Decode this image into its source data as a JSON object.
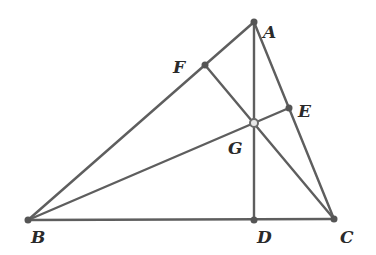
{
  "diagram": {
    "type": "triangle-altitudes-orthocenter",
    "points": {
      "A": {
        "label": "A",
        "x": 254,
        "y": 22,
        "lx": 263,
        "ly": 38
      },
      "B": {
        "label": "B",
        "x": 28,
        "y": 220,
        "lx": 31,
        "ly": 243
      },
      "C": {
        "label": "C",
        "x": 334,
        "y": 219,
        "lx": 340,
        "ly": 243
      },
      "D": {
        "label": "D",
        "x": 254,
        "y": 220,
        "lx": 257,
        "ly": 243
      },
      "E": {
        "label": "E",
        "x": 289,
        "y": 108,
        "lx": 298,
        "ly": 117
      },
      "F": {
        "label": "F",
        "x": 205,
        "y": 65,
        "lx": 173,
        "ly": 73
      },
      "G": {
        "label": "G",
        "x": 254,
        "y": 123,
        "lx": 228,
        "ly": 154
      }
    },
    "segments": [
      [
        "A",
        "B"
      ],
      [
        "A",
        "C"
      ],
      [
        "B",
        "C"
      ],
      [
        "A",
        "D"
      ],
      [
        "B",
        "E"
      ],
      [
        "C",
        "F"
      ]
    ],
    "colors": {
      "line": "#5e5e5e",
      "point": "#555555",
      "label": "#2a2a2a",
      "background": "#ffffff"
    }
  }
}
